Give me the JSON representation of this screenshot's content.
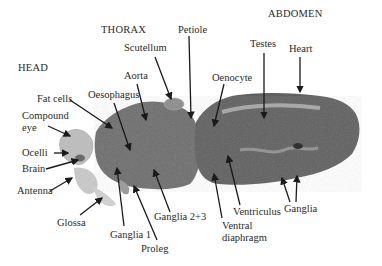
{
  "figure": {
    "type": "labeled micrograph",
    "sections": [
      {
        "id": "head",
        "label": "HEAD",
        "x": 18,
        "y": 62
      },
      {
        "id": "thorax",
        "label": "THORAX",
        "x": 101,
        "y": 24
      },
      {
        "id": "abdomen",
        "label": "ABDOMEN",
        "x": 268,
        "y": 8
      }
    ],
    "labels": [
      {
        "id": "scutellum",
        "text": "Scutellum",
        "x": 124,
        "y": 42
      },
      {
        "id": "petiole",
        "text": "Petiole",
        "x": 178,
        "y": 24
      },
      {
        "id": "aorta",
        "text": "Aorta",
        "x": 124,
        "y": 70
      },
      {
        "id": "oesophagus",
        "text": "Oesophagus",
        "x": 88,
        "y": 89
      },
      {
        "id": "fat-cells",
        "text": "Fat cells",
        "x": 37,
        "y": 93
      },
      {
        "id": "compound-eye",
        "text": "Compound\neye",
        "x": 22,
        "y": 110
      },
      {
        "id": "ocelli",
        "text": "Ocelli",
        "x": 22,
        "y": 147
      },
      {
        "id": "brain",
        "text": "Brain",
        "x": 22,
        "y": 163
      },
      {
        "id": "antenna",
        "text": "Antenna",
        "x": 17,
        "y": 185
      },
      {
        "id": "glossa",
        "text": "Glossa",
        "x": 57,
        "y": 217
      },
      {
        "id": "ganglia-1",
        "text": "Ganglia 1",
        "x": 110,
        "y": 229
      },
      {
        "id": "proleg",
        "text": "Proleg",
        "x": 141,
        "y": 243
      },
      {
        "id": "ganglia-2-3",
        "text": "Ganglia 2+3",
        "x": 154,
        "y": 211
      },
      {
        "id": "oenocyte",
        "text": "Oenocyte",
        "x": 212,
        "y": 72
      },
      {
        "id": "testes",
        "text": "Testes",
        "x": 250,
        "y": 38
      },
      {
        "id": "heart",
        "text": "Heart",
        "x": 289,
        "y": 43
      },
      {
        "id": "ventral-diaphragm",
        "text": "Ventral\ndiaphragm",
        "x": 222,
        "y": 220
      },
      {
        "id": "ventriculus",
        "text": "Ventriculus",
        "x": 233,
        "y": 206
      },
      {
        "id": "ganglia",
        "text": "Ganglia",
        "x": 284,
        "y": 203
      }
    ]
  },
  "colors": {
    "background": "#ffffff",
    "tissue_dark": "#5a5a5a",
    "tissue_mid": "#7a7a7a",
    "tissue_light": "#b8b8b8",
    "label": "#2a2a2a",
    "arrow": "#1a1a1a"
  }
}
